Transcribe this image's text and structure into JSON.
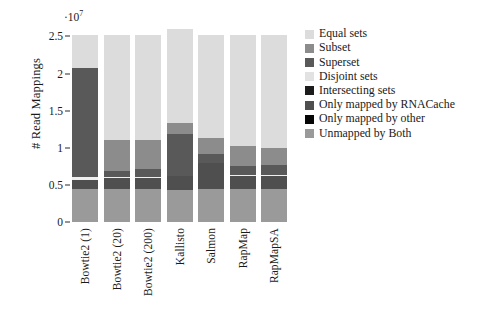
{
  "chart_data": {
    "type": "bar",
    "subtype": "stacked-bar",
    "title": "",
    "xlabel": "",
    "ylabel": "# Read Mappings",
    "y_multiplier_label": "·10",
    "y_multiplier_exp": "7",
    "y_multiplier_value": 10000000,
    "ylim": [
      0,
      2.6
    ],
    "yticks": [
      0,
      0.5,
      1,
      1.5,
      2,
      2.5
    ],
    "ytick_labels": [
      "0",
      "0.5",
      "1",
      "1.5",
      "2",
      "2.5"
    ],
    "grid": false,
    "legend_position": "right",
    "categories": [
      "Bowtie2 (1)",
      "Bowtie2 (20)",
      "Bowtie2 (200)",
      "Kallisto",
      "Salmon",
      "RapMap",
      "RapMapSA"
    ],
    "series": [
      {
        "name": "Unmapped by Both",
        "color": "#9a9a9a",
        "values": [
          0.44,
          0.44,
          0.44,
          0.44,
          0.44,
          0.44,
          0.44
        ]
      },
      {
        "name": "Only mapped by other",
        "color": "#141414",
        "values": [
          0.0,
          0.0,
          0.0,
          0.0,
          0.0,
          0.0,
          0.0
        ]
      },
      {
        "name": "Only mapped by RNACache",
        "color": "#4f4f4f",
        "values": [
          0.13,
          0.15,
          0.15,
          0.18,
          0.36,
          0.18,
          0.18
        ]
      },
      {
        "name": "Intersecting sets",
        "color": "#f0f0f0",
        "values": [
          0.03,
          0.02,
          0.02,
          0.0,
          0.0,
          0.02,
          0.02
        ]
      },
      {
        "name": "Disjoint sets",
        "color": "#e2e2e2",
        "values": [
          0.0,
          0.0,
          0.0,
          0.0,
          0.0,
          0.0,
          0.0
        ]
      },
      {
        "name": "Superset",
        "color": "#595959",
        "values": [
          1.47,
          0.08,
          0.1,
          0.57,
          0.11,
          0.12,
          0.13
        ]
      },
      {
        "name": "Subset",
        "color": "#8c8c8c",
        "values": [
          0.0,
          0.41,
          0.39,
          0.16,
          0.22,
          0.26,
          0.23
        ]
      },
      {
        "name": "Equal sets",
        "color": "#dcdcdc",
        "values": [
          0.45,
          1.42,
          1.42,
          1.27,
          1.39,
          1.5,
          1.52
        ]
      }
    ],
    "stack_order_bottom_to_top": [
      "Unmapped by Both",
      "Only mapped by other",
      "Only mapped by RNACache",
      "Intersecting sets",
      "Disjoint sets",
      "Superset",
      "Subset",
      "Equal sets"
    ],
    "bar_totals": [
      2.52,
      2.52,
      2.52,
      2.62,
      2.52,
      2.52,
      2.52
    ]
  },
  "legend": {
    "entries": [
      {
        "label": "Equal sets",
        "color": "#dcdcdc"
      },
      {
        "label": "Subset",
        "color": "#8c8c8c"
      },
      {
        "label": "Superset",
        "color": "#595959"
      },
      {
        "label": "Disjoint sets",
        "color": "#e2e2e2"
      },
      {
        "label": "Intersecting sets",
        "color": "#1c1c1c"
      },
      {
        "label": "Only mapped by RNACache",
        "color": "#4f4f4f"
      },
      {
        "label": "Only mapped by other",
        "color": "#060606"
      },
      {
        "label": "Unmapped by Both",
        "color": "#9a9a9a"
      }
    ]
  }
}
